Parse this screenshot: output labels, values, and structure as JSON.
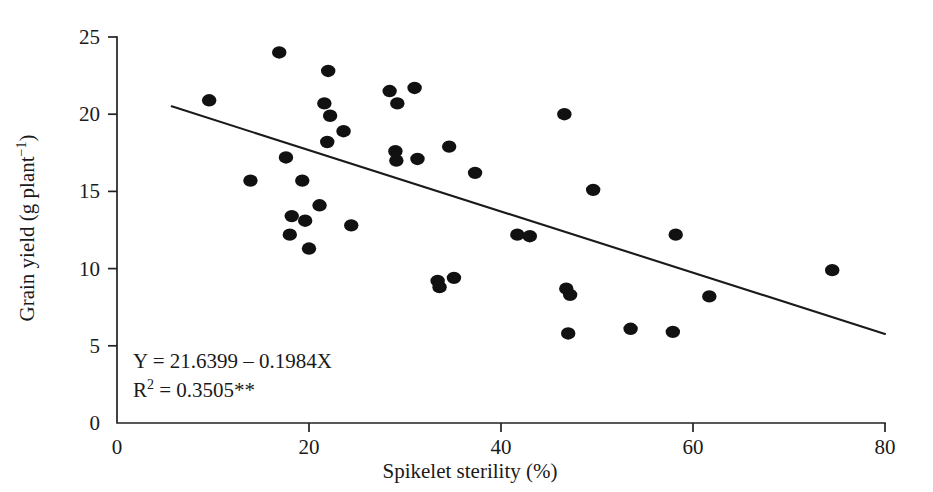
{
  "chart_data": {
    "type": "scatter",
    "title": "",
    "xlabel": "Spikelet sterility (%)",
    "ylabel": "Grain yield (g plant −1)",
    "ylabel_main": "Grain yield (g plant",
    "ylabel_sup": "−1",
    "ylabel_close": ")",
    "xlim": [
      0,
      80
    ],
    "ylim": [
      0,
      25
    ],
    "xticks": [
      0,
      20,
      40,
      60,
      80
    ],
    "yticks": [
      0,
      5,
      10,
      15,
      20,
      25
    ],
    "xtick_labels": [
      "0",
      "20",
      "40",
      "60",
      "80"
    ],
    "ytick_labels": [
      "0",
      "5",
      "10",
      "15",
      "20",
      "25"
    ],
    "grid": false,
    "legend": "none",
    "marker": "filled-circle",
    "marker_color": "#111111",
    "line_color": "#1a1a1a",
    "axis_color": "#222222",
    "points": [
      {
        "x": 9.6,
        "y": 20.9
      },
      {
        "x": 13.9,
        "y": 15.7
      },
      {
        "x": 16.9,
        "y": 24.0
      },
      {
        "x": 17.6,
        "y": 17.2
      },
      {
        "x": 18.2,
        "y": 13.4
      },
      {
        "x": 18.0,
        "y": 12.2
      },
      {
        "x": 19.3,
        "y": 15.7
      },
      {
        "x": 19.6,
        "y": 13.1
      },
      {
        "x": 20.0,
        "y": 11.3
      },
      {
        "x": 21.1,
        "y": 14.1
      },
      {
        "x": 21.6,
        "y": 20.7
      },
      {
        "x": 22.0,
        "y": 22.8
      },
      {
        "x": 22.2,
        "y": 19.9
      },
      {
        "x": 21.9,
        "y": 18.2
      },
      {
        "x": 23.6,
        "y": 18.9
      },
      {
        "x": 24.4,
        "y": 12.8
      },
      {
        "x": 28.4,
        "y": 21.5
      },
      {
        "x": 29.2,
        "y": 20.7
      },
      {
        "x": 29.0,
        "y": 17.6
      },
      {
        "x": 29.1,
        "y": 17.0
      },
      {
        "x": 31.0,
        "y": 21.7
      },
      {
        "x": 31.3,
        "y": 17.1
      },
      {
        "x": 33.4,
        "y": 9.2
      },
      {
        "x": 33.6,
        "y": 8.8
      },
      {
        "x": 34.6,
        "y": 17.9
      },
      {
        "x": 35.1,
        "y": 9.4
      },
      {
        "x": 37.3,
        "y": 16.2
      },
      {
        "x": 41.7,
        "y": 12.2
      },
      {
        "x": 43.0,
        "y": 12.1
      },
      {
        "x": 46.6,
        "y": 20.0
      },
      {
        "x": 46.8,
        "y": 8.7
      },
      {
        "x": 47.2,
        "y": 8.3
      },
      {
        "x": 47.0,
        "y": 5.8
      },
      {
        "x": 49.6,
        "y": 15.1
      },
      {
        "x": 53.5,
        "y": 6.1
      },
      {
        "x": 57.9,
        "y": 5.9
      },
      {
        "x": 58.2,
        "y": 12.2
      },
      {
        "x": 61.7,
        "y": 8.2
      },
      {
        "x": 74.5,
        "y": 9.9
      }
    ],
    "regression": {
      "equation_line1": "Y = 21.6399 – 0.1984X",
      "equation_line2_prefix": "R",
      "equation_line2_sup": "2",
      "equation_line2_rest": " = 0.3505**",
      "intercept": 21.6399,
      "slope": -0.1984,
      "r_squared": 0.3505,
      "significance": "**",
      "x_start": 5.7,
      "x_end": 80.0
    }
  }
}
